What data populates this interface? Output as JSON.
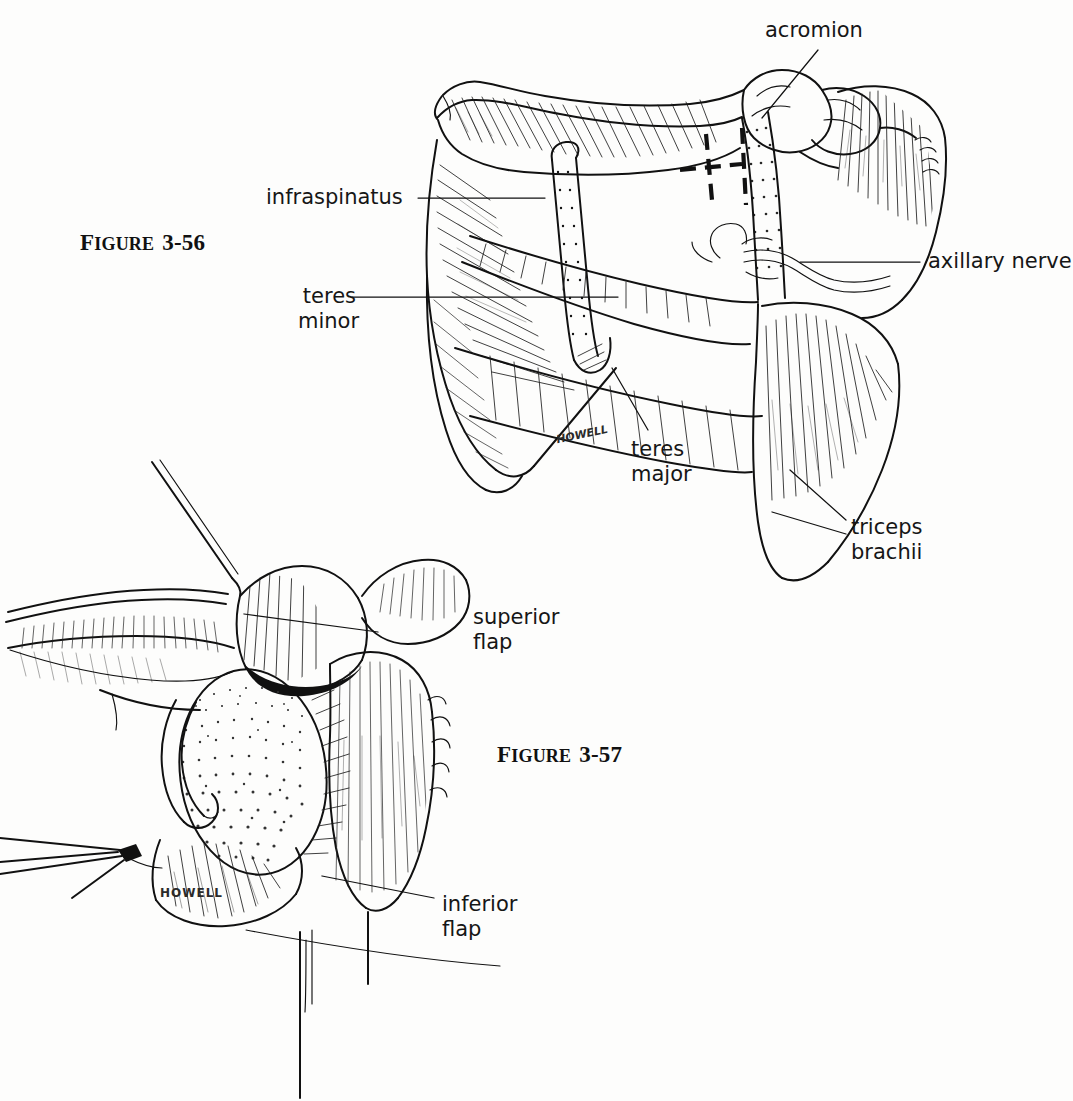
{
  "page": {
    "background_color": "#fdfdfc",
    "ink_color": "#111111"
  },
  "figures": [
    {
      "id": "figure-3-56",
      "caption_prefix": "F",
      "caption_word": "IGURE",
      "caption_number": "3-56",
      "caption_full": "FIGURE 3-56",
      "signature": "HOWELL",
      "labels": [
        {
          "name": "acromion",
          "lines": [
            "acromion"
          ],
          "align": "left"
        },
        {
          "name": "infraspinatus",
          "lines": [
            "infraspinatus"
          ],
          "align": "right"
        },
        {
          "name": "teres-minor",
          "lines": [
            "teres",
            "minor"
          ],
          "align": "right"
        },
        {
          "name": "axillary-nerve",
          "lines": [
            "axillary nerve"
          ],
          "align": "left"
        },
        {
          "name": "teres-major",
          "lines": [
            "teres",
            "major"
          ],
          "align": "left"
        },
        {
          "name": "triceps-brachii",
          "lines": [
            "triceps",
            "brachii"
          ],
          "align": "left"
        }
      ]
    },
    {
      "id": "figure-3-57",
      "caption_prefix": "F",
      "caption_word": "IGURE",
      "caption_number": "3-57",
      "caption_full": "FIGURE 3-57",
      "signature": "HOWELL",
      "labels": [
        {
          "name": "superior-flap",
          "lines": [
            "superior",
            "flap"
          ],
          "align": "left"
        },
        {
          "name": "inferior-flap",
          "lines": [
            "inferior",
            "flap"
          ],
          "align": "left"
        }
      ]
    }
  ]
}
